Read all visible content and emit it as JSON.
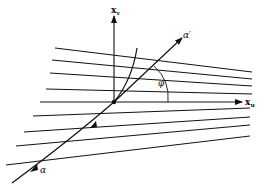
{
  "diagram": {
    "labels": {
      "vertical_axis": "x",
      "vertical_axis_sub": "v",
      "horizontal_axis": "x",
      "horizontal_axis_sub": "u",
      "angle": "φ",
      "curve_start": "α",
      "curve_end": "α′"
    },
    "colors": {
      "ink": "#111111",
      "background": "#ffffff"
    },
    "lines": [
      {
        "x1": 55,
        "y1": 48,
        "x2": 252,
        "y2": 72
      },
      {
        "x1": 52,
        "y1": 60,
        "x2": 252,
        "y2": 79
      },
      {
        "x1": 50,
        "y1": 73,
        "x2": 252,
        "y2": 86
      },
      {
        "x1": 46,
        "y1": 89,
        "x2": 252,
        "y2": 94
      },
      {
        "x1": 33,
        "y1": 116,
        "x2": 250,
        "y2": 108
      },
      {
        "x1": 24,
        "y1": 132,
        "x2": 250,
        "y2": 117
      },
      {
        "x1": 16,
        "y1": 146,
        "x2": 250,
        "y2": 125
      },
      {
        "x1": 6,
        "y1": 165,
        "x2": 250,
        "y2": 136
      }
    ]
  }
}
